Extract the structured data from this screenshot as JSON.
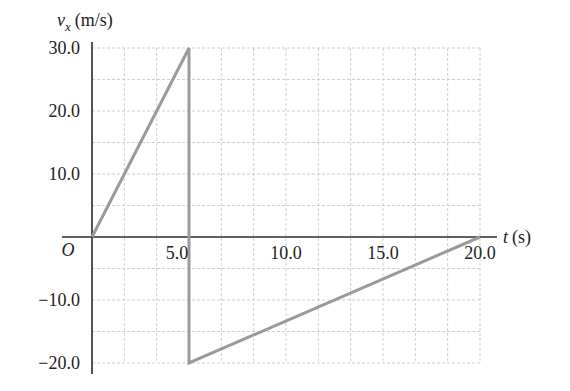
{
  "chart_data": {
    "type": "line",
    "title": "",
    "xlabel": "t (s)",
    "ylabel": "v_x (m/s)",
    "x_axis_symbol": "t",
    "x_axis_unit": "(s)",
    "y_axis_symbol": "v",
    "y_axis_subscript": "x",
    "y_axis_unit": "(m/s)",
    "origin_label": "O",
    "xlim": [
      0,
      20.0
    ],
    "ylim": [
      -20.0,
      30.0
    ],
    "x_ticks": [
      5.0,
      10.0,
      15.0,
      20.0
    ],
    "x_tick_labels": [
      "5.0",
      "10.0",
      "15.0",
      "20.0"
    ],
    "y_ticks": [
      30.0,
      20.0,
      10.0,
      -10.0,
      -20.0
    ],
    "y_tick_labels": [
      "30.0",
      "20.0",
      "10.0",
      "−10.0",
      "−20.0"
    ],
    "grid": true,
    "grid_x_step": 1.667,
    "grid_y_step": 5.0,
    "series": [
      {
        "name": "v_x",
        "x": [
          0,
          5.0,
          5.0,
          20.0
        ],
        "y": [
          0,
          30.0,
          -20.0,
          0
        ],
        "color": "#9a9a9a"
      }
    ],
    "legend": null
  }
}
